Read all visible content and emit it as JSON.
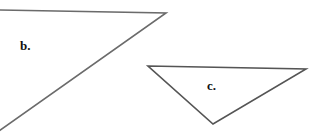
{
  "figure": {
    "shapes": [
      {
        "id": "b",
        "label": "b.",
        "type": "triangle",
        "points": [
          [
            -4,
            10
          ],
          [
            166,
            13
          ],
          [
            -4,
            133
          ]
        ],
        "stroke": "#6b6b6b"
      },
      {
        "id": "c",
        "label": "c.",
        "type": "triangle",
        "points": [
          [
            148,
            66
          ],
          [
            306,
            69
          ],
          [
            213,
            124
          ]
        ],
        "stroke": "#555555"
      }
    ],
    "labels": {
      "b": "b.",
      "c": "c."
    },
    "colors": {
      "background": "#ffffff",
      "stroke": "#5f5f5f",
      "text": "#111111"
    }
  }
}
